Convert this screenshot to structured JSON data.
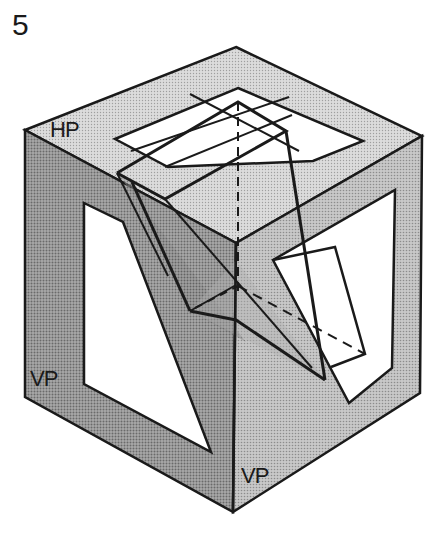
{
  "figure": {
    "number": "5",
    "labels": {
      "horizontal_plane": "HP",
      "vertical_plane_left": "VP",
      "vertical_plane_right": "VP"
    },
    "colors": {
      "ink": "#1a1a1a",
      "top_face": "#d6d6d6",
      "left_face": "#9a9a9a",
      "right_face": "#bdbdbd",
      "window": "#ffffff",
      "solid_shadow": "#888888"
    }
  }
}
